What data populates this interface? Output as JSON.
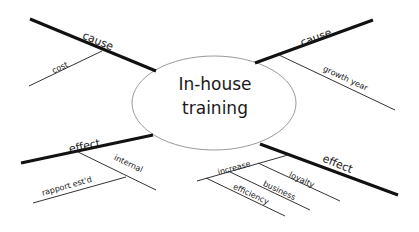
{
  "diagram": {
    "type": "cause-effect-mind-map",
    "center": {
      "line1": "In-house",
      "line2": "training"
    },
    "branches": [
      {
        "position": "top-left",
        "label": "cause",
        "sub_items": [
          {
            "label": "cost"
          }
        ]
      },
      {
        "position": "top-right",
        "label": "cause",
        "sub_items": [
          {
            "label": "growth year"
          }
        ]
      },
      {
        "position": "bottom-left",
        "label": "effect",
        "sub_items": [
          {
            "label": "internal"
          },
          {
            "label": "rapport est'd"
          }
        ]
      },
      {
        "position": "bottom-right",
        "label": "effect",
        "sub_items": [
          {
            "label": "increase"
          },
          {
            "label": "loyalty"
          },
          {
            "label": "business"
          },
          {
            "label": "efficiency"
          }
        ]
      }
    ],
    "colors": {
      "main_line": "#111111",
      "sub_line": "#333333",
      "ellipse_stroke": "#9a9a9a",
      "background": "#ffffff"
    }
  }
}
